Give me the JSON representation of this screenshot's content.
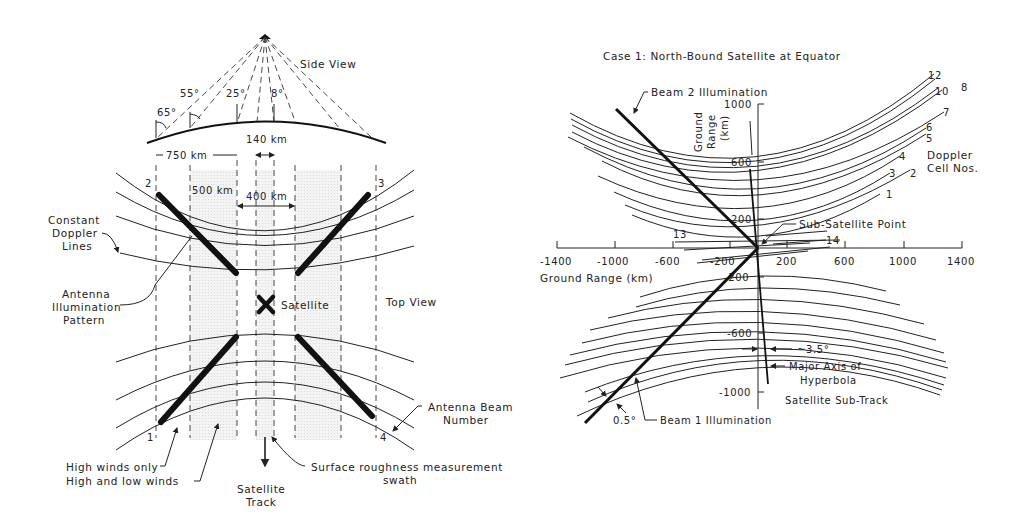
{
  "left_figure": {
    "side_view": {
      "title": "Side View",
      "angles": [
        "65°",
        "55°",
        "25°",
        "8°"
      ],
      "dims": {
        "swath_750": "750 km",
        "swath_140": "140 km"
      }
    },
    "top_view": {
      "title": "Top View",
      "dims": {
        "swath_500": "500 km",
        "swath_400": "400 km"
      },
      "beam_numbers": [
        "1",
        "2",
        "3",
        "4"
      ],
      "satellite_label": "Satellite",
      "labels": {
        "constant_doppler": [
          "Constant",
          "Doppler",
          "Lines"
        ],
        "illumination": [
          "Antenna",
          "Illumination",
          "Pattern"
        ],
        "beam_number": [
          "Antenna Beam",
          "Number"
        ],
        "high_winds_only": "High winds only",
        "high_low_winds": "High and low winds",
        "satellite_track": [
          "Satellite",
          "Track"
        ],
        "surface_roughness": [
          "Surface roughness measurement",
          "swath"
        ]
      }
    }
  },
  "right_figure": {
    "title": "Case 1: North-Bound Satellite at Equator",
    "x_axis": {
      "label": "Ground Range (km)",
      "ticks": [
        "-1400",
        "-1000",
        "-600",
        "-200",
        "200",
        "600",
        "1000",
        "1400"
      ]
    },
    "y_axis": {
      "label": [
        "Ground",
        "Range",
        "(km)"
      ],
      "ticks_pos": [
        "1000",
        "600",
        "200"
      ],
      "ticks_neg": [
        "-200",
        "-600",
        "-1000"
      ]
    },
    "doppler_cells": {
      "label": [
        "Doppler",
        "Cell Nos."
      ],
      "numbers": [
        "12",
        "10",
        "8",
        "7",
        "6",
        "5",
        "4",
        "3",
        "2",
        "1",
        "13",
        "14"
      ]
    },
    "annotations": {
      "beam2": "Beam 2 Illumination",
      "beam1": "Beam 1 Illumination",
      "sub_satellite": "Sub-Satellite Point",
      "angle_35": "~3.5°",
      "major_axis": [
        "Major Axis of",
        "Hyperbola"
      ],
      "sub_track": "Satellite Sub-Track",
      "angle_05": "0.5°"
    }
  }
}
